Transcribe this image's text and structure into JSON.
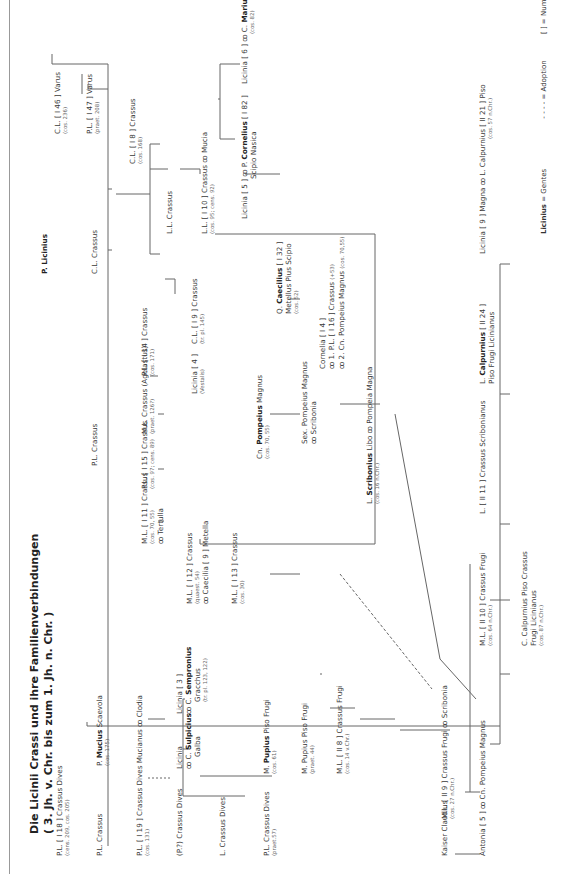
{
  "title": {
    "line1": "Die Licinii Crassi und ihre Familienverbindungen",
    "line2": "( 3. Jh. v. Chr. bis zum 1. Jh. n. Chr. )"
  },
  "root": {
    "name": "P. Licinius"
  },
  "persons": {
    "pl_crassus_1": {
      "name": "P.L. Crassus"
    },
    "cl_crassus_1": {
      "name": "C.L. Crassus"
    },
    "cl_i46": {
      "name": "C.L. [ I 46 ] Varus",
      "sub": "(cos. 236)"
    },
    "pl_i47": {
      "name": "P.L. [ I 47 ] Varus",
      "sub": "(praet. 208)"
    },
    "cl_i8": {
      "name": "C.L. [ I 8 ] Crassus",
      "sub": "(cos. 168)"
    },
    "ll_crassus": {
      "name": "L.L. Crassus"
    },
    "ll_i10": {
      "name": "L.L. [ I 10 ] Crassus ꝏ Mucia",
      "sub": "(cos. 95; cens. 92)"
    },
    "licinia5": {
      "name": "Licinia [ 5 ] ꝏ P. ",
      "bold": "Cornelius",
      "rest": " [ I 82 ]",
      "line2": "Scipio Nasica"
    },
    "licinia6": {
      "name": "Licinia [ 6 ] ꝏ C. ",
      "bold": "Marius",
      "sub": "(cos. 82)"
    },
    "caecilius": {
      "pre": "Q. ",
      "bold": "Caecilius",
      "rest": " [ I 32 ]",
      "line2": "Metellus Pius Scipio",
      "sub": "(cos. 52)"
    },
    "cornelia": {
      "name": "Cornelia [ I 4 ]",
      "line2": "ꝏ 1. P.L. [ I 16 ] Crassus",
      "line2sub": "(+53)",
      "line3": "ꝏ 2. Cn. Pompeius Magnus",
      "line3sub": "(cos. 70,55)"
    },
    "pl_i14": {
      "name": "P.L. [ I 14 ] Crassus",
      "sub": "(cos. 171)"
    },
    "ml_agelastus": {
      "name": "M.L. Crassus (Agelastus)",
      "sub": "(praet. 126?)"
    },
    "pl_i15": {
      "name": "P.L. [ I 15 ] Crassus",
      "sub": "(cos. 97; cens. 89)"
    },
    "cl_i9": {
      "name": "C.L. [ I 9 ] Crassus",
      "sub": "(tr. pl. 145)"
    },
    "licinia4": {
      "name": "Licinia [ 4 ]",
      "sub": "(Vestalis)"
    },
    "ml_i11": {
      "name": "M.L. [ I 11 ] Crassus",
      "sub": "(cos. 70, 55)",
      "line3": "ꝏ Tertulla"
    },
    "pompeius": {
      "pre": "Cn. ",
      "bold": "Pompeius",
      "rest": " Magnus",
      "sub": "(cos. 70, 55)"
    },
    "ml_i12": {
      "name": "M.L. [ I 12 ] Crassus",
      "sub": "(quaest. 54)",
      "line3": "ꝏ Caecilia [ 9 ] Metella"
    },
    "ml_i13": {
      "name": "M.L. [ I 13 ] Crassus",
      "sub": "(cos. 30)"
    },
    "sex_pompeius": {
      "name": "Sex. Pompeius Magnus",
      "line2": "ꝏ Scribonia"
    },
    "scribonius": {
      "pre": "L. ",
      "bold": "Scribonius",
      "rest": " Libo ꝏ Pompeia Magna",
      "sub": "(cos. 16 n.Chr.)"
    },
    "pl_i18": {
      "name": "P.L. [ I 18 ] Crassus Dives",
      "sub": "(cens. 209, cos. 205)"
    },
    "pl_crassus_2": {
      "name": "P.L. Crassus"
    },
    "mucius": {
      "pre": "P. ",
      "bold": "Mucius",
      "rest": " Scaevola",
      "sub": "(cos. 175)"
    },
    "pl_i19": {
      "name": "P.L. [ I 19 ] Crassus Dives Mucianus ꝏ Clodia",
      "sub": "(cos. 131)"
    },
    "p_crassus_dives": {
      "name": "(P.?) Crassus Dives"
    },
    "licinia_galba": {
      "name": "Licinia",
      "line2pre": "ꝏ C. ",
      "line2bold": "Sulpicius",
      "line3": "Galba"
    },
    "licinia3": {
      "name": "Licinia [ 3 ]",
      "line2pre": "ꝏ C. ",
      "line2bold": "Sempronius",
      "line3": "Gracchus",
      "sub": "(tr. pl. 123, 122)"
    },
    "l_crassus_dives": {
      "name": "L. Crassus Dives"
    },
    "pl_crassus_dives": {
      "name": "P.L. Crassus Dives",
      "sub": "(praet.57)"
    },
    "pupius1": {
      "pre": "M. ",
      "bold": "Pupius",
      "rest": " Piso Frugi",
      "sub": "(cos. 61)"
    },
    "pupius2": {
      "name": "M. Pupius Piso Frugi",
      "sub": "(praet. 44)"
    },
    "ml_ii8": {
      "name": "M.L. [ II 8 ] Crassus Frugi",
      "sub": "(cos. 14 v.Chr.)"
    },
    "ml_ii9": {
      "name": "M.L. [ II 9 ] Crassus Frugi ꝏ Scribonia",
      "sub": "(cos. 27 n.Chr.)"
    },
    "kaiser": {
      "name": "Kaiser Claudius"
    },
    "antonia": {
      "name": "Antonia [ 5 ] ꝏ Cn. Pompeius Magnus"
    },
    "ml_ii10": {
      "name": "M.L. [ II 10 ] Crassus Frugi",
      "sub": "(cos. 64 n.Chr.)"
    },
    "c_calpurnius": {
      "name": "C. Calpurnius Piso Crassus",
      "line2": "Frugi Licinianus",
      "sub": "(cos. 87 n.Chr.)"
    },
    "l_ii11": {
      "name": "L. [ II 11 ] Crassus Scribonianus"
    },
    "l_calpurnius_ii24": {
      "pre": "L. ",
      "bold": "Calpurnius",
      "rest": " [ II 24 ]",
      "line2": "Piso Frugi Licinianus"
    },
    "licinia9": {
      "name": "Licinia [ 9 ] Magna ꝏ L. Calpurnius [ II 21 ] Piso",
      "sub": "(cos. 57 n.Chr.)"
    }
  },
  "legend": {
    "gentes_bold": "Licinius",
    "gentes_rest": " = Gentes",
    "adoption": "- - - -  = Adoption",
    "numbering": "[   ] = Nummerierung nach DNP"
  }
}
